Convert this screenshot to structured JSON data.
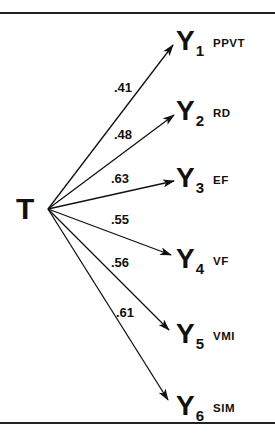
{
  "diagram": {
    "source": {
      "label": "T"
    },
    "targets": [
      {
        "id": "Y1",
        "letter": "Y",
        "subscript": "1",
        "abbr": "PPVT",
        "coef": ".41"
      },
      {
        "id": "Y2",
        "letter": "Y",
        "subscript": "2",
        "abbr": "RD",
        "coef": ".48"
      },
      {
        "id": "Y3",
        "letter": "Y",
        "subscript": "3",
        "abbr": "EF",
        "coef": ".63"
      },
      {
        "id": "Y4",
        "letter": "Y",
        "subscript": "4",
        "abbr": "VF",
        "coef": ".55"
      },
      {
        "id": "Y5",
        "letter": "Y",
        "subscript": "5",
        "abbr": "VMI",
        "coef": ".56"
      },
      {
        "id": "Y6",
        "letter": "Y",
        "subscript": "6",
        "abbr": "SIM",
        "coef": ".61"
      }
    ],
    "line_color": "#111111"
  }
}
